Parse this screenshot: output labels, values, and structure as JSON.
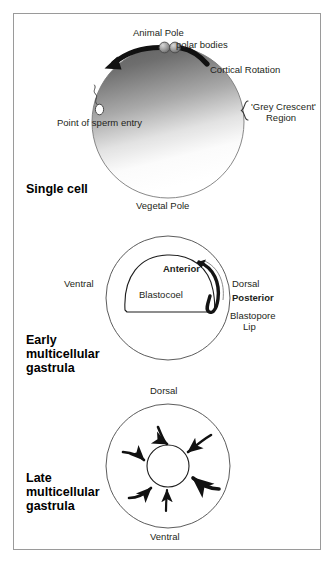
{
  "figure": {
    "border_color": "#9a9a9a",
    "background": "#ffffff",
    "ink_color": "#231f20"
  },
  "panels": [
    {
      "id": "single-cell",
      "stage_label": "Single cell",
      "labels": {
        "animal_pole": "Animal Pole",
        "polar_bodies": "polar bodies",
        "cortical_rotation": "Cortical Rotation",
        "grey_crescent": "'Grey Crescent'\nRegion",
        "grey_crescent_line1": "'Grey Crescent'",
        "grey_crescent_line2": "Region",
        "sperm_entry": "Point of sperm entry",
        "vegetal_pole": "Vegetal Pole"
      }
    },
    {
      "id": "early-gastrula",
      "stage_label": "Early\nmulticellular\ngastrula",
      "stage_label_lines": [
        "Early",
        "multicellular",
        "gastrula"
      ],
      "labels": {
        "ventral": "Ventral",
        "anterior": "Anterior",
        "blastocoel": "Blastocoel",
        "dorsal": "Dorsal",
        "posterior": "Posterior",
        "blastopore_lip_line1": "Blastopore",
        "blastopore_lip_line2": "Lip"
      }
    },
    {
      "id": "late-gastrula",
      "stage_label": "Late\nmulticellular\ngastrula",
      "stage_label_lines": [
        "Late",
        "multicellular",
        "gastrula"
      ],
      "labels": {
        "dorsal": "Dorsal",
        "ventral": "Ventral"
      }
    }
  ]
}
